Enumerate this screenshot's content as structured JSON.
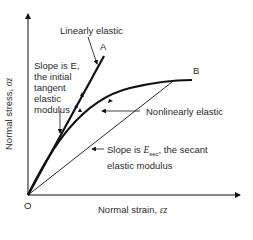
{
  "diagram": {
    "axes": {
      "y_label": "Normal stress, ",
      "y_symbol": "σz",
      "x_label": "Normal strain, ",
      "x_symbol": "εz",
      "origin_label": "O"
    },
    "curves": {
      "linear": {
        "end_label": "A",
        "name": "Linearly elastic"
      },
      "nonlinear": {
        "end_label": "B",
        "name": "Nonlinearly elastic"
      }
    },
    "annotations": {
      "tangent": [
        "Slope is E,",
        "the initial",
        "tangent",
        "elastic",
        "modulus"
      ],
      "secant_line1_prefix": "Slope is ",
      "secant_symbol": "E",
      "secant_sub": "sec",
      "secant_line1_suffix": ", the secant",
      "secant_line2": "elastic modulus"
    },
    "colors": {
      "ink": "#111111",
      "text": "#2a2a2a",
      "background": "#ffffff"
    }
  }
}
